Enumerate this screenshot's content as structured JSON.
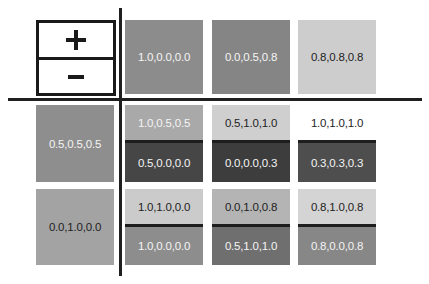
{
  "legend": {
    "plus_symbol": "+",
    "minus_symbol": "−"
  },
  "header_row": [
    {
      "label": "1.0,0.0,0.0",
      "bg": "#8c8c8c",
      "text": "light"
    },
    {
      "label": "0.0,0.5,0.8",
      "bg": "#858585",
      "text": "light"
    },
    {
      "label": "0.8,0.8,0.8",
      "bg": "#cdcdcd",
      "text": "dark"
    }
  ],
  "rows": [
    {
      "left": {
        "label": "0.5,0.5,0.5",
        "bg": "#8e8e8e",
        "text": "light"
      },
      "cells": [
        {
          "top": {
            "label": "1.0,0.5,0.5",
            "bg": "#a9a9a9",
            "text": "light"
          },
          "bottom": {
            "label": "0.5,0.0,0.0",
            "bg": "#464646",
            "text": "light"
          }
        },
        {
          "top": {
            "label": "0.5,1.0,1.0",
            "bg": "#cfcfcf",
            "text": "dark"
          },
          "bottom": {
            "label": "0.0,0.0,0.3",
            "bg": "#3d3d3d",
            "text": "light"
          }
        },
        {
          "top": {
            "label": "1.0,1.0,1.0",
            "bg": "#ffffff",
            "text": "dark"
          },
          "bottom": {
            "label": "0.3,0.3,0.3",
            "bg": "#4e4e4e",
            "text": "light"
          }
        }
      ]
    },
    {
      "left": {
        "label": "0.0,1.0,0.0",
        "bg": "#a3a3a3",
        "text": "dark"
      },
      "cells": [
        {
          "top": {
            "label": "1.0,1.0,0.0",
            "bg": "#cbcbcb",
            "text": "dark"
          },
          "bottom": {
            "label": "1.0,0.0,0.0",
            "bg": "#8d8d8d",
            "text": "light"
          }
        },
        {
          "top": {
            "label": "0.0,1.0,0.8",
            "bg": "#b4b4b4",
            "text": "dark"
          },
          "bottom": {
            "label": "0.5,1.0,1.0",
            "bg": "#6f6f6f",
            "text": "light"
          }
        },
        {
          "top": {
            "label": "0.8,1.0,0.8",
            "bg": "#d4d4d4",
            "text": "dark"
          },
          "bottom": {
            "label": "0.8,0.0,0.8",
            "bg": "#878787",
            "text": "light"
          }
        }
      ]
    }
  ],
  "colors": {
    "grid_line": "#1f1f1f",
    "background": "#ffffff"
  }
}
